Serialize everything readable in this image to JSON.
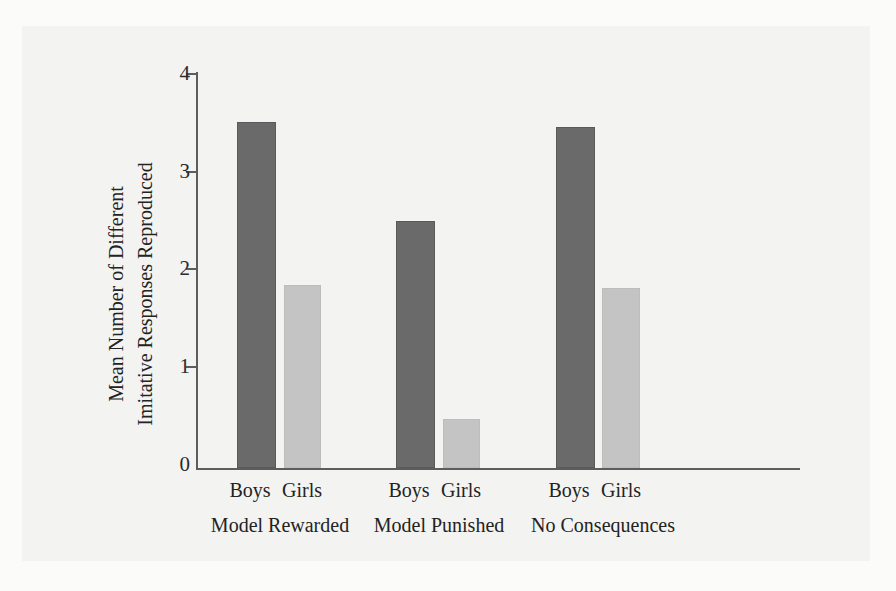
{
  "chart_data": {
    "type": "bar",
    "title": "",
    "xlabel": "",
    "ylabel": "Mean Number of Different Imitative Responses Reproduced",
    "ylabel_lines": [
      "Mean Number of Different",
      "Imitative Responses Reproduced"
    ],
    "categories": [
      "Model Rewarded",
      "Model Punished",
      "No Consequences"
    ],
    "series": [
      {
        "name": "Boys",
        "values": [
          3.5,
          2.5,
          3.45
        ],
        "color": "#6a6a6a"
      },
      {
        "name": "Girls",
        "values": [
          1.85,
          0.5,
          1.82
        ],
        "color": "#c4c4c4"
      }
    ],
    "ylim": [
      0,
      4
    ],
    "yticks": [
      0,
      1,
      2,
      3,
      4
    ],
    "ytick_labels": [
      "0",
      "1",
      "2",
      "3",
      "4"
    ],
    "grid": false,
    "legend": "none",
    "group_series_labels": [
      "Boys",
      "Girls"
    ]
  },
  "colors": {
    "background": "#f3f3f1",
    "page_border": "#fbfbfa",
    "axis": "#5d5d5d",
    "text": "#232323",
    "boys_bar": "#6a6a6a",
    "girls_bar": "#c4c4c4"
  }
}
